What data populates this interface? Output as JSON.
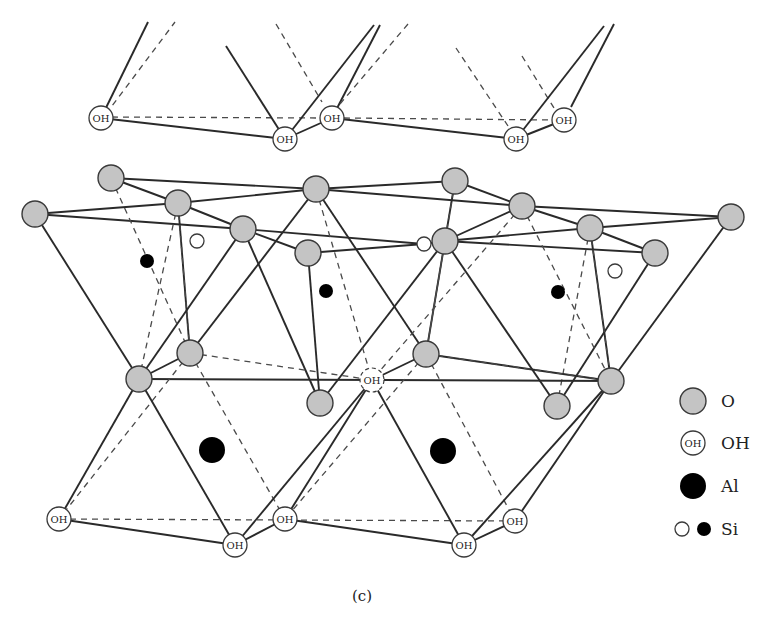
{
  "figure": {
    "caption": "(c)"
  },
  "colors": {
    "oxygen_fill": "#c4c4c4",
    "line": "#2a2a2a",
    "aluminum": "#000000",
    "background": "#ffffff"
  },
  "atom_label": "OH",
  "legend": {
    "items": [
      {
        "symbol": "gray-filled-circle",
        "label": "O"
      },
      {
        "symbol": "circle-with-OH",
        "label": "OH",
        "inner_text": "OH"
      },
      {
        "symbol": "large-black-circle",
        "label": "Al"
      },
      {
        "symbol": "open-and-filled-small-circles",
        "label": "Si"
      }
    ]
  }
}
